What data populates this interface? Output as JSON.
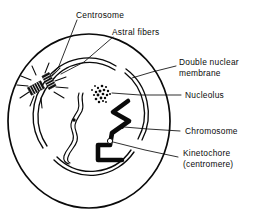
{
  "figure": {
    "palette": {
      "ink": "#0a0a0a",
      "background": "#ffffff",
      "label_text": "#0b0b0b"
    }
  },
  "labels": {
    "centrosome": "Centrosome",
    "astral_fibers": "Astral fibers",
    "double_nuclear_membrane_line1": "Double nuclear",
    "double_nuclear_membrane_line2": "membrane",
    "nucleolus": "Nucleolus",
    "chromosome": "Chromosome",
    "kinetochore_line1": "Kinetochore",
    "kinetochore_line2": "(centromere)"
  },
  "structures": [
    {
      "id": "cell-membrane",
      "name": "Cell membrane",
      "shape": "circle-outline"
    },
    {
      "id": "nuclear-envelope",
      "name": "Double nuclear membrane",
      "shape": "broken-double-arc"
    },
    {
      "id": "centrosome",
      "name": "Centrosome",
      "shape": "paired-centrioles"
    },
    {
      "id": "astral-fibers",
      "name": "Astral fibers",
      "shape": "radiating-lines"
    },
    {
      "id": "nucleolus",
      "name": "Nucleolus",
      "shape": "stippled-cluster"
    },
    {
      "id": "chromosome-thin",
      "name": "Chromosome (unreplicated)",
      "shape": "wavy-outline"
    },
    {
      "id": "chromosome-thick",
      "name": "Chromosome (condensed)",
      "shape": "wavy-solid"
    },
    {
      "id": "kinetochore",
      "name": "Kinetochore (centromere)",
      "shape": "small-ring"
    }
  ]
}
